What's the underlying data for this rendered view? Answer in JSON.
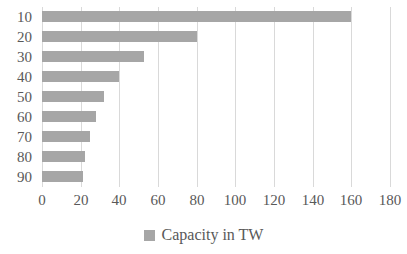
{
  "chart_data": {
    "type": "bar",
    "orientation": "horizontal",
    "title": "",
    "xlabel": "",
    "ylabel": "",
    "categories": [
      "10",
      "20",
      "30",
      "40",
      "50",
      "60",
      "70",
      "80",
      "90"
    ],
    "series": [
      {
        "name": "Capacity in TW",
        "color": "#a6a6a6",
        "values": [
          160,
          80,
          53,
          40,
          32,
          28,
          25,
          22,
          21
        ]
      }
    ],
    "xlim": [
      0,
      180
    ],
    "x_ticks": [
      0,
      20,
      40,
      60,
      80,
      100,
      120,
      140,
      160,
      180
    ],
    "y_ticks": [
      "10",
      "20",
      "30",
      "40",
      "50",
      "60",
      "70",
      "80",
      "90"
    ],
    "grid": "vertical",
    "legend": {
      "position": "bottom",
      "entries": [
        {
          "label": "Capacity in TW",
          "color": "#a6a6a6"
        }
      ]
    }
  },
  "colors": {
    "bar": "#a6a6a6",
    "gridline": "#d9d9d9",
    "text": "#595959",
    "background": "#ffffff"
  }
}
